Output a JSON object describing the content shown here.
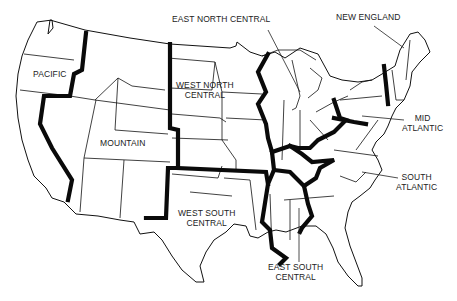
{
  "map": {
    "title": "U.S. Census Divisions",
    "regions": [
      {
        "id": "pacific",
        "label": "PACIFIC"
      },
      {
        "id": "mountain",
        "label": "MOUNTAIN"
      },
      {
        "id": "west_north_central",
        "label_line1": "WEST NORTH",
        "label_line2": "CENTRAL"
      },
      {
        "id": "east_north_central",
        "label": "EAST NORTH CENTRAL"
      },
      {
        "id": "new_england",
        "label": "NEW ENGLAND"
      },
      {
        "id": "mid_atlantic",
        "label_line1": "MID",
        "label_line2": "ATLANTIC"
      },
      {
        "id": "south_atlantic",
        "label_line1": "SOUTH",
        "label_line2": "ATLANTIC"
      },
      {
        "id": "west_south_central",
        "label_line1": "WEST SOUTH",
        "label_line2": "CENTRAL"
      },
      {
        "id": "east_south_central",
        "label_line1": "EAST SOUTH",
        "label_line2": "CENTRAL"
      }
    ],
    "colors": {
      "background": "#ffffff",
      "lines": "#111111"
    }
  }
}
